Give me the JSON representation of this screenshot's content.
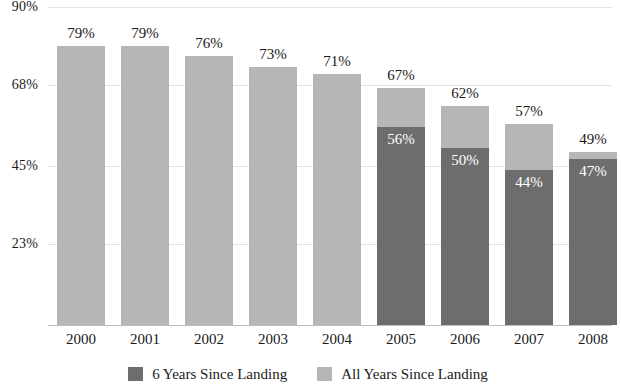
{
  "chart_data": {
    "type": "bar",
    "title": "",
    "subtitle": "",
    "xlabel": "",
    "ylabel": "",
    "stacked": true,
    "grid": true,
    "legend_position": "bottom",
    "ylim": [
      0,
      90
    ],
    "ytick_labels": [
      "90%",
      "68%",
      "45%",
      "23%"
    ],
    "ytick_values": [
      90,
      68,
      45,
      23
    ],
    "categories": [
      "2000",
      "2001",
      "2002",
      "2003",
      "2004",
      "2005",
      "2006",
      "2007",
      "2008"
    ],
    "series": [
      {
        "name": "6 Years Since Landing",
        "color": "#6d6d6d",
        "values": [
          null,
          null,
          null,
          null,
          null,
          56,
          50,
          44,
          47
        ],
        "value_labels": [
          "",
          "",
          "",
          "",
          "",
          "56%",
          "50%",
          "44%",
          "47%"
        ]
      },
      {
        "name": "All Years Since Landing",
        "color": "#b6b6b6",
        "values": [
          79,
          79,
          76,
          73,
          71,
          67,
          62,
          57,
          49
        ],
        "value_labels": [
          "79%",
          "79%",
          "76%",
          "73%",
          "71%",
          "67%",
          "62%",
          "57%",
          "49%"
        ]
      }
    ]
  },
  "legend": {
    "items": [
      {
        "label": "6 Years Since Landing",
        "color": "#6d6d6d"
      },
      {
        "label": "All Years Since Landing",
        "color": "#b6b6b6"
      }
    ]
  },
  "colors": {
    "dark_gray": "#6d6d6d",
    "light_gray": "#b6b6b6",
    "gridline": "#e2e2e2",
    "axis": "#bdbdbd",
    "text": "#1a1a1a",
    "background": "#ffffff"
  }
}
